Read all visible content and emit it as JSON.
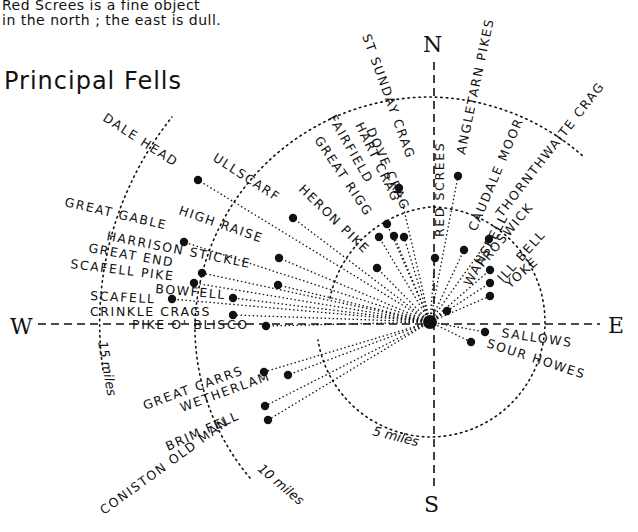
{
  "caption": {
    "line1": "Red Screes is a fine object",
    "line2": "in the north ; the east is dull."
  },
  "title": "Principal Fells",
  "compass": {
    "north": "N",
    "south": "S",
    "east": "E",
    "west": "W"
  },
  "distance_rings": [
    {
      "label": "5 miles",
      "radius": 115
    },
    {
      "label": "10 miles",
      "radius": 235
    },
    {
      "label": "15 miles",
      "radius": 330
    }
  ],
  "center": {
    "x": 430,
    "y": 322
  },
  "fells": [
    {
      "name": "DALE HEAD",
      "dot": [
        198,
        180
      ]
    },
    {
      "name": "ULLSCARF",
      "dot": [
        293,
        218
      ]
    },
    {
      "name": "HERON PIKE",
      "dot": [
        377,
        268
      ]
    },
    {
      "name": "GREAT RIGG",
      "dot": [
        379,
        237
      ]
    },
    {
      "name": "FAIRFIELD",
      "dot": [
        387,
        224
      ]
    },
    {
      "name": "HART CRAG",
      "dot": [
        394,
        236
      ]
    },
    {
      "name": "DOVE CRAG",
      "dot": [
        404,
        237
      ]
    },
    {
      "name": "ST SUNDAY CRAG",
      "dot": [
        399,
        188
      ]
    },
    {
      "name": "RED SCREES",
      "dot": [
        435,
        258
      ]
    },
    {
      "name": "ANGLETARN PIKES",
      "dot": [
        458,
        176
      ]
    },
    {
      "name": "CAUDALE MOOR",
      "dot": [
        464,
        250
      ]
    },
    {
      "name": "THORNTHWAITE CRAG",
      "dot": [
        489,
        239
      ]
    },
    {
      "name": "WANSFELL",
      "dot": [
        447,
        311
      ]
    },
    {
      "name": "FROSWICK",
      "dot": [
        490,
        270
      ]
    },
    {
      "name": "ILL BELL",
      "dot": [
        490,
        283
      ]
    },
    {
      "name": "YOKE",
      "dot": [
        490,
        296
      ]
    },
    {
      "name": "SALLOWS",
      "dot": [
        485,
        332
      ]
    },
    {
      "name": "SOUR HOWES",
      "dot": [
        471,
        342
      ]
    },
    {
      "name": "GREAT GABLE",
      "dot": [
        184,
        242
      ]
    },
    {
      "name": "HIGH RAISE",
      "dot": [
        279,
        258
      ]
    },
    {
      "name": "HARRISON STICKLE",
      "dot": [
        278,
        285
      ]
    },
    {
      "name": "GREAT END",
      "dot": [
        202,
        273
      ]
    },
    {
      "name": "SCAFELL PIKE",
      "dot": [
        194,
        283
      ]
    },
    {
      "name": "BOWFELL",
      "dot": [
        233,
        298
      ]
    },
    {
      "name": "SCAFELL",
      "dot": [
        172,
        299
      ]
    },
    {
      "name": "CRINKLE CRAGS",
      "dot": [
        233,
        315
      ]
    },
    {
      "name": "PIKE O' BLISCO",
      "dot": [
        266,
        326
      ]
    },
    {
      "name": "GREAT CARRS",
      "dot": [
        264,
        372
      ]
    },
    {
      "name": "WETHERLAM",
      "dot": [
        288,
        375
      ]
    },
    {
      "name": "BRIM FELL",
      "dot": [
        265,
        406
      ]
    },
    {
      "name": "CONISTON OLD MAN",
      "dot": [
        268,
        420
      ]
    }
  ]
}
